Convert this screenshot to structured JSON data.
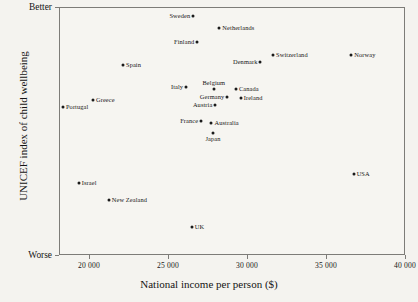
{
  "chart_data": {
    "type": "scatter",
    "title": "",
    "xlabel": "National income per person ($)",
    "ylabel": "UNICEF index of child wellbeing",
    "xlim": [
      18100,
      40000
    ],
    "ylim": [
      0,
      100
    ],
    "grid": false,
    "legend": "none",
    "xticks": [
      {
        "value": 20000,
        "label": "20 000"
      },
      {
        "value": 25000,
        "label": "25 000"
      },
      {
        "value": 30000,
        "label": "30 000"
      },
      {
        "value": 35000,
        "label": "35 000"
      },
      {
        "value": 40000,
        "label": "40 000"
      }
    ],
    "yticks": [
      {
        "value": 100,
        "label": "Better"
      },
      {
        "value": 0,
        "label": "Worse"
      }
    ],
    "points": [
      {
        "name": "Sweden",
        "x": 26600,
        "y": 96.4,
        "label_pos": "left"
      },
      {
        "name": "Netherlands",
        "x": 28250,
        "y": 91.6,
        "label_pos": "right"
      },
      {
        "name": "Finland",
        "x": 26850,
        "y": 86.0,
        "label_pos": "left"
      },
      {
        "name": "Denmark",
        "x": 30850,
        "y": 78.0,
        "label_pos": "left"
      },
      {
        "name": "Switzerland",
        "x": 31650,
        "y": 80.7,
        "label_pos": "right"
      },
      {
        "name": "Norway",
        "x": 36600,
        "y": 80.7,
        "label_pos": "right"
      },
      {
        "name": "Spain",
        "x": 22150,
        "y": 76.6,
        "label_pos": "right"
      },
      {
        "name": "Italy",
        "x": 26150,
        "y": 67.8,
        "label_pos": "left"
      },
      {
        "name": "Belgium",
        "x": 27900,
        "y": 67.0,
        "label_pos": "above"
      },
      {
        "name": "Canada",
        "x": 29300,
        "y": 67.0,
        "label_pos": "right"
      },
      {
        "name": "Germany",
        "x": 28750,
        "y": 63.7,
        "label_pos": "left"
      },
      {
        "name": "Ireland",
        "x": 29600,
        "y": 63.3,
        "label_pos": "right"
      },
      {
        "name": "Austria",
        "x": 28000,
        "y": 60.5,
        "label_pos": "left"
      },
      {
        "name": "Greece",
        "x": 20250,
        "y": 62.5,
        "label_pos": "right"
      },
      {
        "name": "Portugal",
        "x": 18350,
        "y": 59.7,
        "label_pos": "right"
      },
      {
        "name": "France",
        "x": 27100,
        "y": 54.0,
        "label_pos": "left"
      },
      {
        "name": "Australia",
        "x": 27750,
        "y": 53.2,
        "label_pos": "right"
      },
      {
        "name": "Japan",
        "x": 27850,
        "y": 49.2,
        "label_pos": "below"
      },
      {
        "name": "USA",
        "x": 36750,
        "y": 32.7,
        "label_pos": "right"
      },
      {
        "name": "Israel",
        "x": 19350,
        "y": 29.0,
        "label_pos": "right"
      },
      {
        "name": "New Zealand",
        "x": 21250,
        "y": 22.2,
        "label_pos": "right"
      },
      {
        "name": "UK",
        "x": 26500,
        "y": 11.3,
        "label_pos": "right"
      }
    ]
  }
}
